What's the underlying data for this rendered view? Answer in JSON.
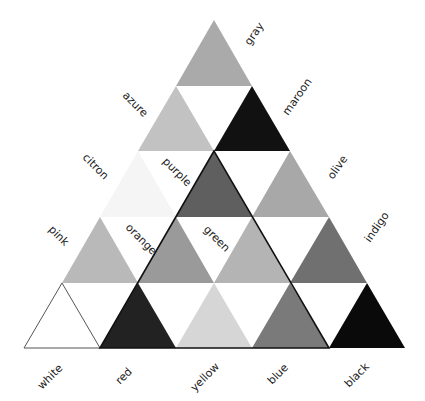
{
  "diagram": {
    "type": "triangular color-name grid (grayscale)",
    "rows": [
      [
        {
          "name": "gray",
          "fill": "#aaaaaa"
        }
      ],
      [
        {
          "name": "azure",
          "fill": "#c2c2c2"
        },
        {
          "name": "maroon",
          "fill": "#111111"
        }
      ],
      [
        {
          "name": "citron",
          "fill": "#f5f5f5"
        },
        {
          "name": "purple",
          "fill": "#5f5f5f"
        },
        {
          "name": "olive",
          "fill": "#a8a8a8"
        }
      ],
      [
        {
          "name": "pink",
          "fill": "#b9b9b9"
        },
        {
          "name": "orange",
          "fill": "#9a9a9a"
        },
        {
          "name": "green",
          "fill": "#b4b4b4"
        },
        {
          "name": "indigo",
          "fill": "#707070"
        }
      ],
      [
        {
          "name": "white",
          "fill": "#ffffff"
        },
        {
          "name": "red",
          "fill": "#222222"
        },
        {
          "name": "yellow",
          "fill": "#d6d6d6"
        },
        {
          "name": "blue",
          "fill": "#7a7a7a"
        },
        {
          "name": "black",
          "fill": "#0a0a0a"
        }
      ]
    ],
    "labels": {
      "gray": "gray",
      "azure": "azure",
      "maroon": "maroon",
      "citron": "citron",
      "purple": "purple",
      "olive": "olive",
      "pink": "pink",
      "orange": "orange",
      "green": "green",
      "indigo": "indigo",
      "white": "white",
      "red": "red",
      "yellow": "yellow",
      "blue": "blue",
      "black": "black"
    }
  }
}
